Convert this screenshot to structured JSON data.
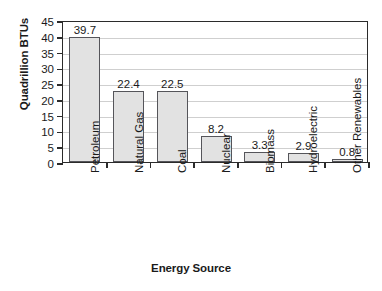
{
  "chart_data": {
    "type": "bar",
    "title": "",
    "subtitle": "",
    "xlabel": "Energy Source",
    "ylabel": "Quadrillion BTUs",
    "categories": [
      "Petroleum",
      "Natural Gas",
      "Coal",
      "Nuclear",
      "Biomass",
      "Hydroelectric",
      "Other Renewables"
    ],
    "values": [
      39.7,
      22.4,
      22.5,
      8.2,
      3.3,
      2.9,
      0.8
    ],
    "value_labels": [
      "39.7",
      "22.4",
      "22.5",
      "8.2",
      "3.3",
      "2.9",
      "0.8"
    ],
    "ylim": [
      0,
      45
    ],
    "ytick_labels": [
      "0",
      "5",
      "10",
      "15",
      "20",
      "25",
      "30",
      "35",
      "40",
      "45"
    ],
    "ytick_values": [
      0,
      5,
      10,
      15,
      20,
      25,
      30,
      35,
      40,
      45
    ],
    "grid": "horizontal",
    "legend": "none",
    "bar_color": "#e2e2e2",
    "bar_border_color": "#55555a",
    "axis_color": "#2b2b2b",
    "gridline_color": "#cfcfcf",
    "text_color": "#1a1a1a",
    "background_color": "#ffffff"
  }
}
